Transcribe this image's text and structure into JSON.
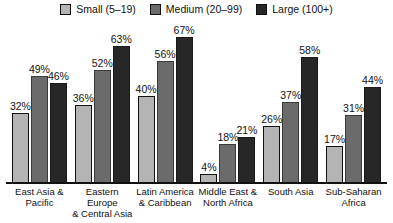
{
  "legend": {
    "items": [
      {
        "label": "Small (5–19)",
        "swatch_name": "legend-swatch-small",
        "color": "#b4b4b4"
      },
      {
        "label": "Medium (20–99)",
        "swatch_name": "legend-swatch-medium",
        "color": "#6b6b6b"
      },
      {
        "label": "Large (100+)",
        "swatch_name": "legend-swatch-large",
        "color": "#272727"
      }
    ]
  },
  "chart_data": {
    "type": "bar",
    "title": "",
    "subtitle": "",
    "xlabel": "",
    "ylabel": "",
    "ylim": [
      0,
      72
    ],
    "grid": false,
    "legend_position": "top-center",
    "value_labels": true,
    "value_suffix": "%",
    "categories": [
      "East Asia & Pacific",
      "Eastern Europe & Central Asia",
      "Latin America & Caribbean",
      "Middle East & North Africa",
      "South Asia",
      "Sub-Saharan Africa"
    ],
    "category_lines": [
      [
        "East Asia &",
        "Pacific"
      ],
      [
        "Eastern Europe",
        "& Central Asia"
      ],
      [
        "Latin America",
        "& Caribbean"
      ],
      [
        "Middle East &",
        "North Africa"
      ],
      [
        "South Asia",
        ""
      ],
      [
        "Sub-Saharan",
        "Africa"
      ]
    ],
    "series": [
      {
        "name": "Small (5–19)",
        "color": "#b4b4b4",
        "values": [
          32,
          36,
          40,
          4,
          26,
          17
        ],
        "labels": [
          "32%",
          "36%",
          "40%",
          "4%",
          "26%",
          "17%"
        ]
      },
      {
        "name": "Medium (20–99)",
        "color": "#6b6b6b",
        "values": [
          49,
          52,
          56,
          18,
          37,
          31
        ],
        "labels": [
          "49%",
          "52%",
          "56%",
          "18%",
          "37%",
          "31%"
        ]
      },
      {
        "name": "Large (100+)",
        "color": "#272727",
        "values": [
          46,
          63,
          67,
          21,
          58,
          44
        ],
        "labels": [
          "46%",
          "63%",
          "67%",
          "21%",
          "58%",
          "44%"
        ]
      }
    ]
  }
}
